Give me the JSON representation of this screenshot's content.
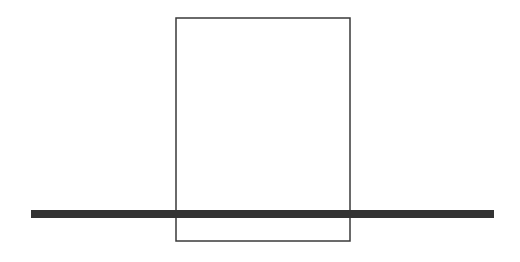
{
  "diagram": {
    "background": "#ffffff",
    "rectangle": {
      "x": 176,
      "y": 18,
      "width": 174,
      "height": 223,
      "stroke": "#3a3a3a",
      "stroke_width": 1.5,
      "fill": "none"
    },
    "bar": {
      "x1": 31,
      "x2": 494,
      "y": 214,
      "thickness": 8,
      "color": "#333333"
    }
  }
}
